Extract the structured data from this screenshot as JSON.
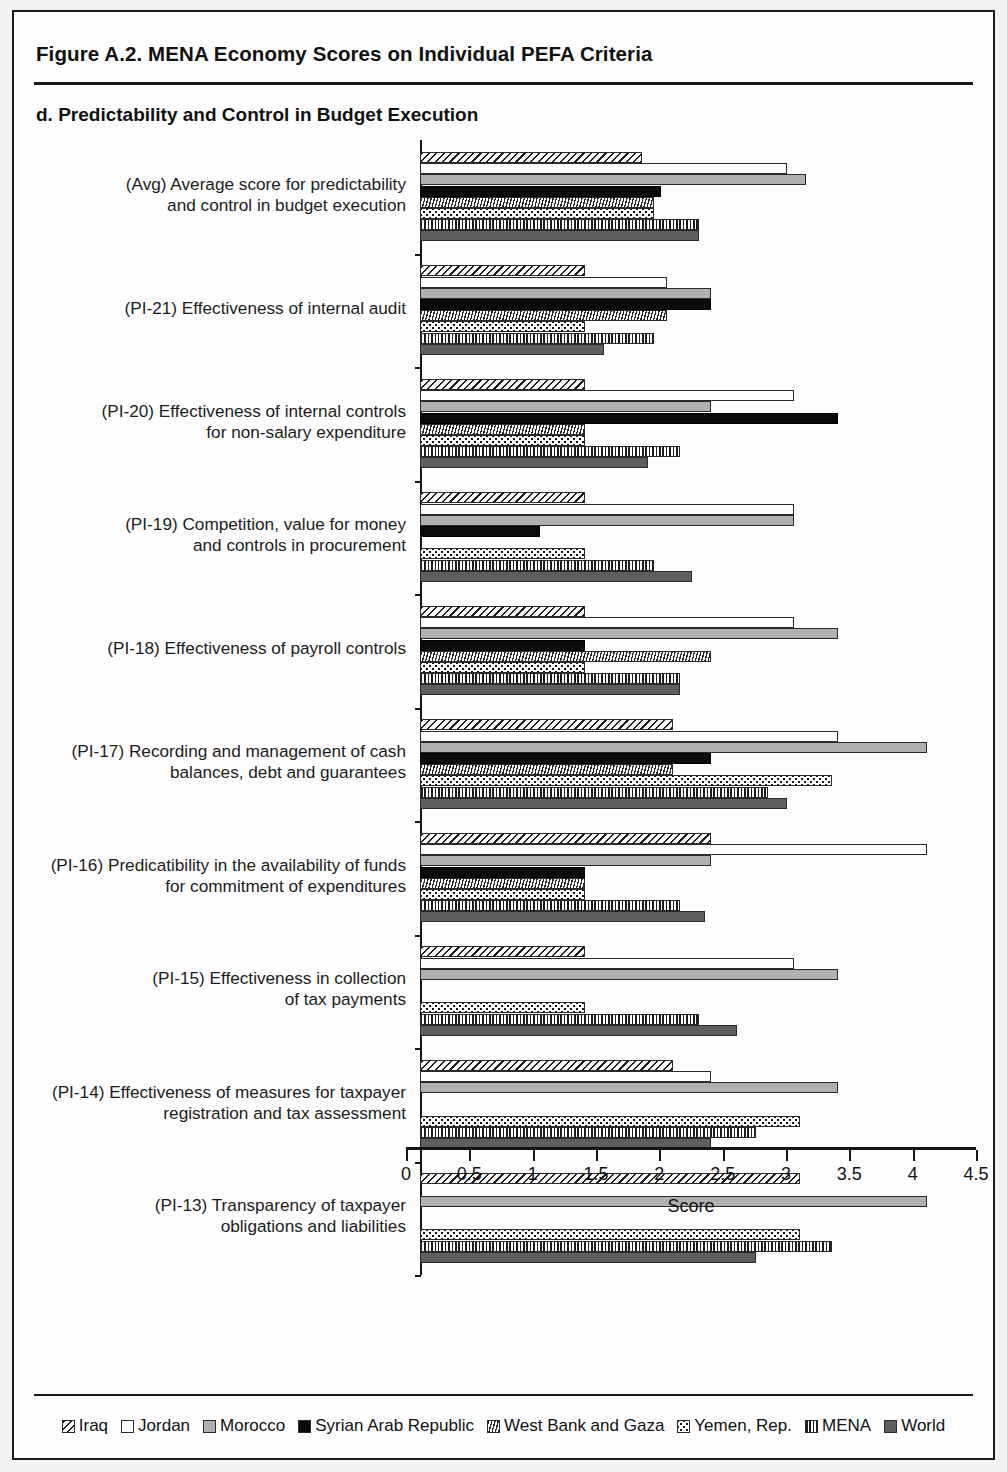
{
  "figure": {
    "title": "Figure A.2. MENA Economy Scores on Individual PEFA Criteria",
    "panel_title": "d. Predictability and Control in Budget Execution"
  },
  "chart_data": {
    "type": "bar",
    "orientation": "horizontal",
    "title": "d. Predictability and Control in Budget Execution",
    "xlabel": "Score",
    "ylabel": "",
    "xlim": [
      0,
      4.5
    ],
    "xticks": [
      "0",
      "0.5",
      "1",
      "1.5",
      "2",
      "2.5",
      "3",
      "3.5",
      "4",
      "4.5"
    ],
    "xtick_values": [
      0,
      0.5,
      1,
      1.5,
      2,
      2.5,
      3,
      3.5,
      4,
      4.5
    ],
    "grid": false,
    "legend_position": "bottom",
    "categories": [
      "(Avg) Average score for predictability\nand control in budget execution",
      "(PI-21) Effectiveness of internal audit",
      "(PI-20) Effectiveness of internal controls\nfor non-salary expenditure",
      "(PI-19) Competition, value for money\nand controls in procurement",
      "(PI-18) Effectiveness of payroll controls",
      "(PI-17) Recording and management of cash\nbalances, debt and guarantees",
      "(PI-16) Predicatibility in the availability of funds\nfor commitment of expenditures",
      "(PI-15) Effectiveness in collection\nof tax payments",
      "(PI-14) Effectiveness of measures for taxpayer\nregistration and tax assessment",
      "(PI-13) Transparency of taxpayer\nobligations and liabilities"
    ],
    "series": [
      {
        "name": "Iraq",
        "pattern": "diagonal-hatch",
        "values": [
          1.75,
          1.3,
          1.3,
          1.3,
          1.3,
          2.0,
          2.3,
          1.3,
          2.0,
          3.0
        ]
      },
      {
        "name": "Jordan",
        "pattern": "solid-white",
        "values": [
          2.9,
          1.95,
          2.95,
          2.95,
          2.95,
          3.3,
          4.0,
          2.95,
          2.3,
          0.0
        ]
      },
      {
        "name": "Morocco",
        "pattern": "solid-light-gray",
        "values": [
          3.05,
          2.3,
          2.3,
          2.95,
          3.3,
          4.0,
          2.3,
          3.3,
          3.3,
          4.0
        ]
      },
      {
        "name": "Syrian Arab Republic",
        "pattern": "solid-black",
        "values": [
          1.9,
          2.3,
          3.3,
          0.95,
          1.3,
          2.3,
          1.3,
          0.0,
          0.0,
          0.0
        ]
      },
      {
        "name": "West Bank and Gaza",
        "pattern": "fine-hatch",
        "values": [
          1.85,
          1.95,
          1.3,
          0.0,
          2.3,
          2.0,
          1.3,
          0.0,
          0.0,
          0.0
        ]
      },
      {
        "name": "Yemen, Rep.",
        "pattern": "dotted-grid",
        "values": [
          1.85,
          1.3,
          1.3,
          1.3,
          1.3,
          3.25,
          1.3,
          1.3,
          3.0,
          3.0
        ]
      },
      {
        "name": "MENA",
        "pattern": "vertical-lines",
        "values": [
          2.2,
          1.85,
          2.05,
          1.85,
          2.05,
          2.75,
          2.05,
          2.2,
          2.65,
          3.25
        ]
      },
      {
        "name": "World",
        "pattern": "solid-dark-gray",
        "values": [
          2.2,
          1.45,
          1.8,
          2.15,
          2.05,
          2.9,
          2.25,
          2.5,
          2.3,
          2.65
        ]
      }
    ]
  },
  "legend": {
    "items": [
      {
        "label": "Iraq",
        "swatch": "diagonal-hatch-swatch"
      },
      {
        "label": "Jordan",
        "swatch": "white-swatch"
      },
      {
        "label": "Morocco",
        "swatch": "light-gray-swatch"
      },
      {
        "label": "Syrian Arab Republic",
        "swatch": "black-swatch"
      },
      {
        "label": "West Bank and Gaza",
        "swatch": "fine-hatch-swatch"
      },
      {
        "label": "Yemen, Rep.",
        "swatch": "dotted-swatch"
      },
      {
        "label": "MENA",
        "swatch": "vertical-lines-swatch"
      },
      {
        "label": "World",
        "swatch": "dark-gray-swatch"
      }
    ]
  }
}
